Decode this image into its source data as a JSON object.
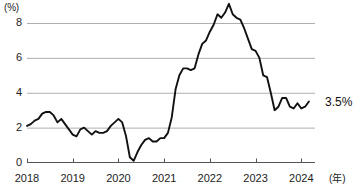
{
  "axes": {
    "y_unit_label": "(%)",
    "x_unit_label": "(年)",
    "y_ticks": [
      "0",
      "2",
      "4",
      "6",
      "8"
    ],
    "x_ticks": [
      "2018",
      "2019",
      "2020",
      "2021",
      "2022",
      "2023",
      "2024"
    ]
  },
  "annotations": {
    "end_value": "3.5%"
  },
  "colors": {
    "line": "#111111",
    "grid": "#9a9a9a",
    "axis": "#555555",
    "text": "#222222"
  },
  "chart_data": {
    "type": "line",
    "title": "",
    "subtitle": "",
    "xlabel": "(年)",
    "ylabel": "(%)",
    "xlim": [
      2018,
      2024.3
    ],
    "ylim": [
      0,
      9.6
    ],
    "grid": true,
    "grid_values": [
      2,
      4,
      6,
      8
    ],
    "legend": "none",
    "x_tick_values": [
      2018,
      2019,
      2020,
      2021,
      2022,
      2023,
      2024
    ],
    "y_tick_values": [
      0,
      2,
      4,
      6,
      8
    ],
    "annotations": [
      {
        "text": "3.5%",
        "x": 2024.3,
        "y": 3.5
      }
    ],
    "series": [
      {
        "name": "消費者物価上昇率",
        "x": [
          2018.0,
          2018.083,
          2018.167,
          2018.25,
          2018.333,
          2018.417,
          2018.5,
          2018.583,
          2018.667,
          2018.75,
          2018.833,
          2018.917,
          2019.0,
          2019.083,
          2019.167,
          2019.25,
          2019.333,
          2019.417,
          2019.5,
          2019.583,
          2019.667,
          2019.75,
          2019.833,
          2019.917,
          2020.0,
          2020.083,
          2020.167,
          2020.25,
          2020.333,
          2020.417,
          2020.5,
          2020.583,
          2020.667,
          2020.75,
          2020.833,
          2020.917,
          2021.0,
          2021.083,
          2021.167,
          2021.25,
          2021.333,
          2021.417,
          2021.5,
          2021.583,
          2021.667,
          2021.75,
          2021.833,
          2021.917,
          2022.0,
          2022.083,
          2022.167,
          2022.25,
          2022.333,
          2022.417,
          2022.5,
          2022.583,
          2022.667,
          2022.75,
          2022.833,
          2022.917,
          2023.0,
          2023.083,
          2023.167,
          2023.25,
          2023.333,
          2023.417,
          2023.5,
          2023.583,
          2023.667,
          2023.75,
          2023.833,
          2023.917,
          2024.0,
          2024.083,
          2024.167
        ],
        "values": [
          2.1,
          2.2,
          2.4,
          2.5,
          2.8,
          2.9,
          2.9,
          2.7,
          2.3,
          2.5,
          2.2,
          1.9,
          1.6,
          1.5,
          1.9,
          2.0,
          1.8,
          1.6,
          1.8,
          1.7,
          1.7,
          1.8,
          2.1,
          2.3,
          2.5,
          2.3,
          1.5,
          0.3,
          0.1,
          0.6,
          1.0,
          1.3,
          1.4,
          1.2,
          1.2,
          1.4,
          1.4,
          1.7,
          2.6,
          4.2,
          5.0,
          5.4,
          5.4,
          5.3,
          5.4,
          6.2,
          6.8,
          7.0,
          7.5,
          7.9,
          8.5,
          8.3,
          8.6,
          9.1,
          8.5,
          8.3,
          8.2,
          7.7,
          7.1,
          6.5,
          6.4,
          6.0,
          5.0,
          4.9,
          4.0,
          3.0,
          3.2,
          3.7,
          3.7,
          3.2,
          3.1,
          3.4,
          3.1,
          3.2,
          3.5
        ]
      }
    ]
  }
}
